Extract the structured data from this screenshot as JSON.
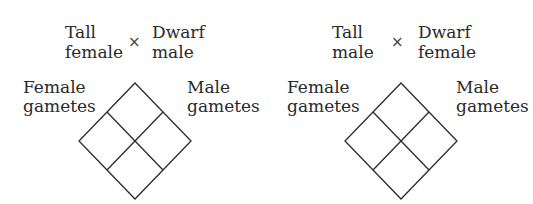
{
  "crosses": [
    {
      "parent1": [
        "Tall",
        "female"
      ],
      "operator": "×",
      "parent2": [
        "Dwarf",
        "male"
      ],
      "left_label": [
        "Female",
        "gametes"
      ],
      "right_label": [
        "Male",
        "gametes"
      ],
      "punnett_grid": {
        "rows": 2,
        "cols": 2
      }
    },
    {
      "parent1": [
        "Tall",
        "male"
      ],
      "operator": "×",
      "parent2": [
        "Dwarf",
        "female"
      ],
      "left_label": [
        "Female",
        "gametes"
      ],
      "right_label": [
        "Male",
        "gametes"
      ],
      "punnett_grid": {
        "rows": 2,
        "cols": 2
      }
    }
  ]
}
